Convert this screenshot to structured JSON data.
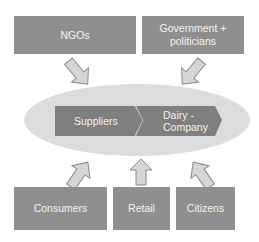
{
  "diagram": {
    "top_boxes": [
      {
        "label": "NGOs"
      },
      {
        "label": "Government +\npoliticians"
      }
    ],
    "center": {
      "chevrons": [
        {
          "label": "Suppliers"
        },
        {
          "label": "Dairy -\nCompany"
        }
      ]
    },
    "bottom_boxes": [
      {
        "label": "Consumers"
      },
      {
        "label": "Retail"
      },
      {
        "label": "Citizens"
      }
    ],
    "colors": {
      "box_fill": "#8f8f8f",
      "chevron_fill": "#7f7f7f",
      "ellipse_fill": "#dcdcdc",
      "arrow_fill": "#d6d6d6",
      "arrow_stroke": "#8a8a8a",
      "text": "#f2f2f2"
    }
  }
}
